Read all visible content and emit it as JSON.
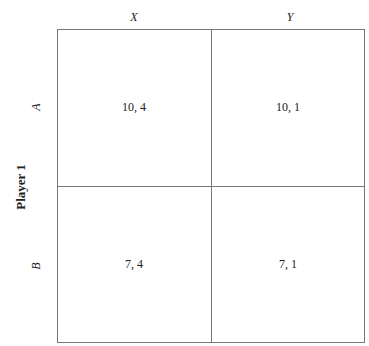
{
  "player1_label": "Player 1",
  "columns": [
    "X",
    "Y"
  ],
  "rows": [
    "A",
    "B"
  ],
  "payoffs": [
    [
      "10, 4",
      "10, 1"
    ],
    [
      "7, 4",
      "7, 1"
    ]
  ],
  "colors": {
    "border": "#777777",
    "text": "#222222"
  }
}
